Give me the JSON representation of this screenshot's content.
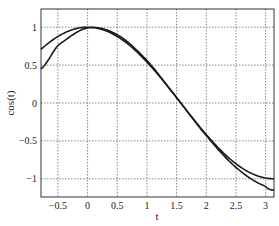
{
  "chart_data": {
    "type": "line",
    "title": "",
    "xlabel": "t",
    "ylabel": "cos(t)",
    "xlim": [
      -0.785,
      3.1416
    ],
    "ylim": [
      -1.24,
      1.24
    ],
    "grid": true,
    "x_ticks": [
      "-0.5",
      "0",
      "0.5",
      "1",
      "1.5",
      "2",
      "2.5",
      "3"
    ],
    "y_ticks": [
      "-1",
      "-0.5",
      "0",
      "0.5",
      "1"
    ],
    "series": [
      {
        "name": "cos(t)",
        "x": [
          -0.785,
          -0.5,
          0,
          0.5,
          1,
          1.5,
          2,
          2.5,
          3,
          3.1416
        ],
        "values": [
          0.71,
          0.88,
          1.0,
          0.88,
          0.54,
          0.07,
          -0.42,
          -0.8,
          -0.99,
          -1.0
        ]
      },
      {
        "name": "approximation",
        "x": [
          -0.785,
          -0.5,
          0,
          0.5,
          1,
          1.5,
          2,
          2.5,
          3,
          3.1416
        ],
        "values": [
          0.45,
          0.76,
          0.99,
          0.9,
          0.56,
          0.07,
          -0.43,
          -0.85,
          -1.1,
          -1.15
        ]
      }
    ],
    "legend": []
  },
  "colors": {
    "line": "#1a1a1a",
    "grid": "#555555",
    "axis": "#333333"
  }
}
